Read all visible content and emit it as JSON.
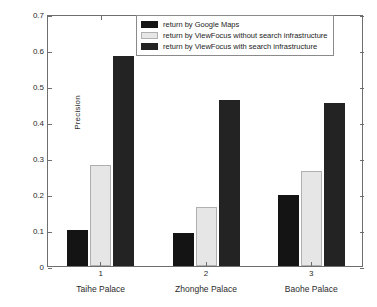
{
  "chart_data": {
    "type": "bar",
    "title": "",
    "xlabel": "",
    "ylabel": "Precision",
    "ylim": [
      0,
      0.7
    ],
    "yticks": [
      "0",
      "0.1",
      "0.2",
      "0.3",
      "0.4",
      "0.5",
      "0.6",
      "0.7"
    ],
    "ytick_values": [
      0,
      0.1,
      0.2,
      0.3,
      0.4,
      0.5,
      0.6,
      0.7
    ],
    "xticks": [
      "1",
      "2",
      "3"
    ],
    "categories": [
      "Taihe Palace",
      "Zhonghe Palace",
      "Baohe Palace"
    ],
    "grid": false,
    "legend_position": "top-center",
    "series": [
      {
        "name": "return by Google Maps",
        "color": "#141414",
        "values": [
          0.1,
          0.091,
          0.197
        ]
      },
      {
        "name": "return by ViewFocus without search infrastructure",
        "color": "#e6e6e6",
        "values": [
          0.28,
          0.164,
          0.264
        ]
      },
      {
        "name": "return by ViewFocus with search infrastructure",
        "color": "#232323",
        "values": [
          0.583,
          0.461,
          0.453
        ]
      }
    ]
  },
  "axis": {
    "frame_color": "#6e6e6e",
    "text_color": "#2b2b2b"
  }
}
